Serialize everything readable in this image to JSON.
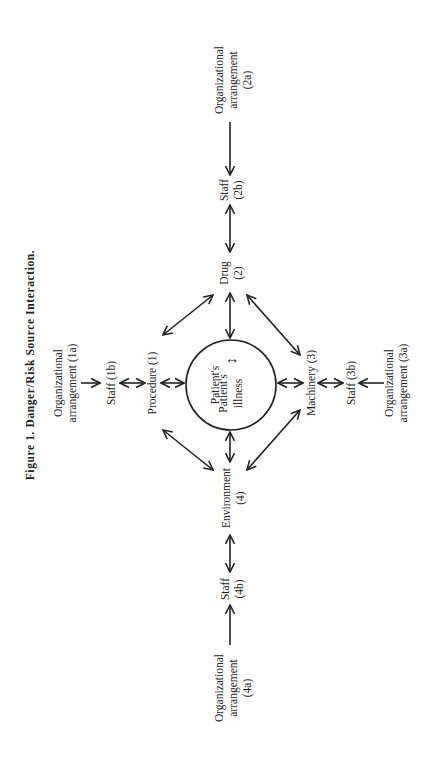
{
  "figure": {
    "caption": "Figure 1. Danger/Risk Source Interaction.",
    "orientation": "rotated 90° counter-clockwise"
  },
  "nodes": {
    "center": {
      "line1": "Patient's",
      "line2": "illness",
      "line3": "(5)",
      "line4": "Patient's",
      "line5": "behavior"
    },
    "procedure": {
      "label": "Procedure (1)"
    },
    "staff_1b": {
      "label": "Staff (1b)"
    },
    "org_1a": {
      "line1": "Organizational",
      "line2": "arrangement (1a)"
    },
    "drug": {
      "line1": "Drug",
      "line2": "(2)"
    },
    "staff_2b": {
      "line1": "Staff",
      "line2": "(2b)"
    },
    "org_2a": {
      "line1": "Organizational",
      "line2": "arrangement",
      "line3": "(2a)"
    },
    "machinery": {
      "label": "Machinery (3)"
    },
    "staff_3b": {
      "label": "Staff (3b)"
    },
    "org_3a": {
      "line1": "Organizational",
      "line2": "arrangement (3a)"
    },
    "environment": {
      "line1": "Environment",
      "line2": "(4)"
    },
    "staff_4b": {
      "line1": "Staff",
      "line2": "(4b)"
    },
    "org_4a": {
      "line1": "Organizational",
      "line2": "arrangement",
      "line3": "(4a)"
    }
  },
  "colors": {
    "ink": "#222222",
    "background": "#ffffff"
  }
}
